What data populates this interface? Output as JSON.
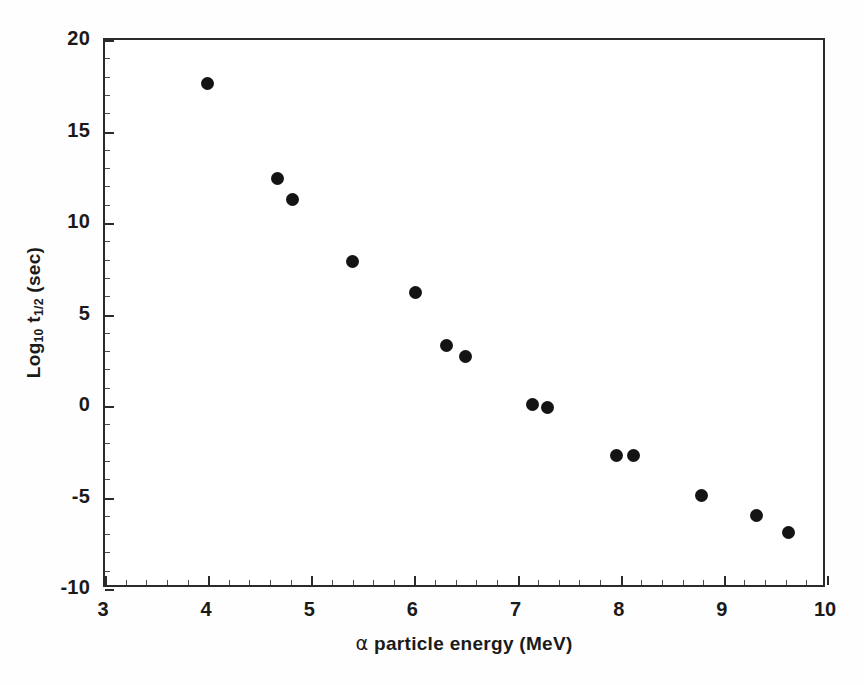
{
  "chart_data": {
    "type": "scatter",
    "title": "",
    "xlabel": "α particle energy (MeV)",
    "ylabel": "Log10 t1/2 (sec)",
    "ylabel_parts": {
      "prefix": "Log",
      "base_subscript": "10",
      "symbol": " t",
      "symbol_subscript": "1/2",
      "suffix": " (sec)"
    },
    "xlabel_parts": {
      "alpha": "α",
      "rest": " particle energy (MeV)"
    },
    "xlim": [
      3,
      10
    ],
    "ylim": [
      -10,
      20
    ],
    "xticks": [
      3,
      4,
      5,
      6,
      7,
      8,
      9,
      10
    ],
    "yticks": [
      -10,
      -5,
      0,
      5,
      10,
      15,
      20
    ],
    "xtick_labels": [
      "3",
      "4",
      "5",
      "6",
      "7",
      "8",
      "9",
      "10"
    ],
    "ytick_labels": [
      "-10",
      "-5",
      "0",
      "5",
      "10",
      "15",
      "20"
    ],
    "x_minor_step": 0.2,
    "y_minor_step": 1,
    "grid": false,
    "legend": false,
    "marker": "filled-circle",
    "marker_color": "#141414",
    "marker_size_px": 13,
    "frame_color": "#2b2b2b",
    "background_color": "#ffffff",
    "x": [
      4.01,
      4.69,
      4.84,
      5.42,
      6.03,
      6.33,
      6.51,
      7.16,
      7.31,
      7.98,
      8.14,
      8.8,
      9.34,
      9.65
    ],
    "y": [
      17.5,
      12.3,
      11.2,
      7.8,
      6.1,
      3.2,
      2.6,
      0.0,
      -0.2,
      -2.8,
      -2.8,
      -5.0,
      -6.1,
      -7.0
    ],
    "points": [
      {
        "x": 4.01,
        "y": 17.5
      },
      {
        "x": 4.69,
        "y": 12.3
      },
      {
        "x": 4.84,
        "y": 11.2
      },
      {
        "x": 5.42,
        "y": 7.8
      },
      {
        "x": 6.03,
        "y": 6.1
      },
      {
        "x": 6.33,
        "y": 3.2
      },
      {
        "x": 6.51,
        "y": 2.6
      },
      {
        "x": 7.16,
        "y": 0.0
      },
      {
        "x": 7.31,
        "y": -0.2
      },
      {
        "x": 7.98,
        "y": -2.8
      },
      {
        "x": 8.14,
        "y": -2.8
      },
      {
        "x": 8.8,
        "y": -5.0
      },
      {
        "x": 9.34,
        "y": -6.1
      },
      {
        "x": 9.65,
        "y": -7.0
      }
    ]
  }
}
